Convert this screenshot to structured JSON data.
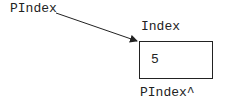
{
  "diagram": {
    "pointer_label": "PIndex",
    "variable_label": "Index",
    "variable_value": "5",
    "dereference_label": "PIndex^",
    "arrow": {
      "from": [
        56,
        13
      ],
      "to": [
        138,
        41
      ]
    }
  }
}
